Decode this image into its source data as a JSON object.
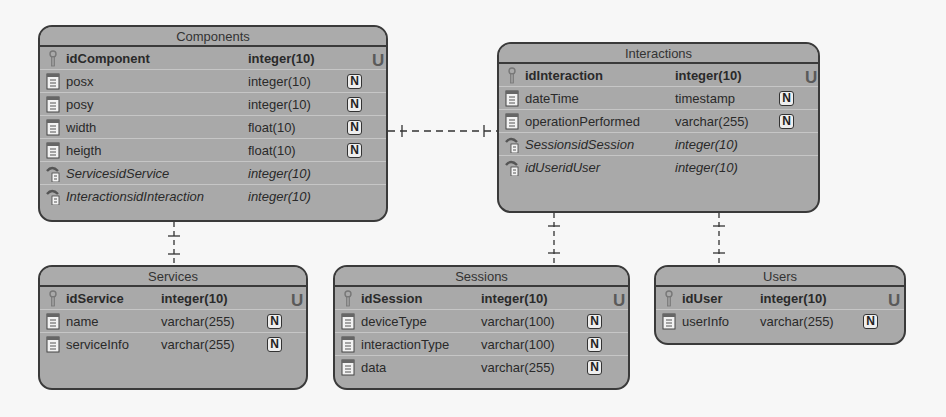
{
  "diagram": {
    "type": "entity-relationship",
    "entities": [
      {
        "name": "Components",
        "fields": [
          {
            "name": "idComponent",
            "type": "integer(10)",
            "kind": "pk",
            "badge": "U",
            "icon": "primary-key-icon"
          },
          {
            "name": "posx",
            "type": "integer(10)",
            "kind": "column",
            "badge": "N",
            "icon": "column-icon"
          },
          {
            "name": "posy",
            "type": "integer(10)",
            "kind": "column",
            "badge": "N",
            "icon": "column-icon"
          },
          {
            "name": "width",
            "type": "float(10)",
            "kind": "column",
            "badge": "N",
            "icon": "column-icon"
          },
          {
            "name": "heigth",
            "type": "float(10)",
            "kind": "column",
            "badge": "N",
            "icon": "column-icon"
          },
          {
            "name": "ServicesidService",
            "type": "integer(10)",
            "kind": "fk",
            "badge": "",
            "icon": "foreign-key-icon"
          },
          {
            "name": "InteractionsidInteraction",
            "type": "integer(10)",
            "kind": "fk",
            "badge": "",
            "icon": "foreign-key-icon"
          }
        ]
      },
      {
        "name": "Interactions",
        "fields": [
          {
            "name": "idInteraction",
            "type": "integer(10)",
            "kind": "pk",
            "badge": "U",
            "icon": "primary-key-icon"
          },
          {
            "name": "dateTime",
            "type": "timestamp",
            "kind": "column",
            "badge": "N",
            "icon": "column-icon"
          },
          {
            "name": "operationPerformed",
            "type": "varchar(255)",
            "kind": "column",
            "badge": "N",
            "icon": "column-icon"
          },
          {
            "name": "SessionsidSession",
            "type": "integer(10)",
            "kind": "fk",
            "badge": "",
            "icon": "foreign-key-icon"
          },
          {
            "name": "idUseridUser",
            "type": "integer(10)",
            "kind": "fk",
            "badge": "",
            "icon": "foreign-key-icon"
          }
        ]
      },
      {
        "name": "Services",
        "fields": [
          {
            "name": "idService",
            "type": "integer(10)",
            "kind": "pk",
            "badge": "U",
            "icon": "primary-key-icon"
          },
          {
            "name": "name",
            "type": "varchar(255)",
            "kind": "column",
            "badge": "N",
            "icon": "column-icon"
          },
          {
            "name": "serviceInfo",
            "type": "varchar(255)",
            "kind": "column",
            "badge": "N",
            "icon": "column-icon"
          }
        ]
      },
      {
        "name": "Sessions",
        "fields": [
          {
            "name": "idSession",
            "type": "integer(10)",
            "kind": "pk",
            "badge": "U",
            "icon": "primary-key-icon"
          },
          {
            "name": "deviceType",
            "type": "varchar(100)",
            "kind": "column",
            "badge": "N",
            "icon": "column-icon"
          },
          {
            "name": "interactionType",
            "type": "varchar(100)",
            "kind": "column",
            "badge": "N",
            "icon": "column-icon"
          },
          {
            "name": "data",
            "type": "varchar(255)",
            "kind": "column",
            "badge": "N",
            "icon": "column-icon"
          }
        ]
      },
      {
        "name": "Users",
        "fields": [
          {
            "name": "idUser",
            "type": "integer(10)",
            "kind": "pk",
            "badge": "U",
            "icon": "primary-key-icon"
          },
          {
            "name": "userInfo",
            "type": "varchar(255)",
            "kind": "column",
            "badge": "N",
            "icon": "column-icon"
          }
        ]
      }
    ],
    "relationships": [
      {
        "from": "Components",
        "to": "Interactions",
        "style": "dashed",
        "cardinality": "one-to-one"
      },
      {
        "from": "Components",
        "to": "Services",
        "style": "dashed",
        "cardinality": "one-to-one"
      },
      {
        "from": "Interactions",
        "to": "Sessions",
        "style": "dashed",
        "cardinality": "one-to-one"
      },
      {
        "from": "Interactions",
        "to": "Users",
        "style": "dashed",
        "cardinality": "one-to-one"
      }
    ]
  },
  "colors": {
    "entity_fill": "#a9a9a9",
    "entity_border": "#3a3a3a",
    "background": "#f7f7f7"
  }
}
